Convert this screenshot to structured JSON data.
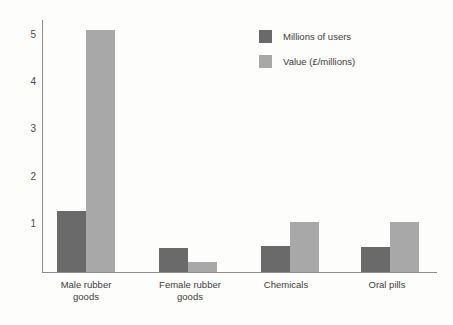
{
  "chart_data": {
    "type": "bar",
    "title": "",
    "subtitle": "",
    "xlabel": "",
    "ylabel": "",
    "ylim": [
      0,
      5.33
    ],
    "yticks": [
      "1",
      "2",
      "3",
      "4",
      "5"
    ],
    "ytick_values": [
      1,
      2,
      3,
      4,
      5
    ],
    "grid": false,
    "legend_position": "top-right",
    "categories": [
      "Male rubber\ngoods",
      "Female rubber\ngoods",
      "Chemicals",
      "Oral pills"
    ],
    "series": [
      {
        "name": "Millions of users",
        "color": "#6a6a6a",
        "values": [
          1.29,
          0.5,
          0.56,
          0.53
        ]
      },
      {
        "name": "Value (£/millions)",
        "color": "#a8a8a8",
        "values": [
          5.12,
          0.22,
          1.05,
          1.05
        ]
      }
    ]
  },
  "legend": {
    "items": [
      {
        "label": "Millions of users",
        "color": "#6a6a6a"
      },
      {
        "label": "Value (£/millions)",
        "color": "#a8a8a8"
      }
    ]
  },
  "colors": {
    "background": "#fdfdfb",
    "axis": "#8d8d8d",
    "text": "#3c3c3c",
    "series_dark": "#6a6a6a",
    "series_light": "#a8a8a8"
  }
}
